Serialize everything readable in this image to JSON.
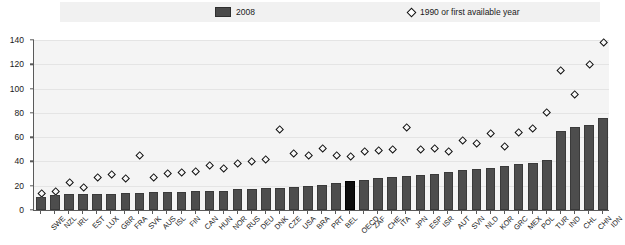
{
  "legend": {
    "bar_label": "2008",
    "marker_label": "1990 or first available year",
    "bar_color": "#4d4d4d",
    "marker_icon": "diamond-open-icon"
  },
  "axes": {
    "y_ticks": [
      0,
      20,
      40,
      60,
      80,
      100,
      120,
      140
    ],
    "y_min": 0,
    "y_max": 140
  },
  "chart_data": {
    "type": "bar",
    "title": "",
    "subtitle": "",
    "xlabel": "",
    "ylabel": "",
    "ylim": [
      0,
      140
    ],
    "grid": true,
    "legend_position": "top",
    "highlight_category": "OECD",
    "categories": [
      "SWE",
      "NZL",
      "IRL",
      "EST",
      "LUX",
      "GBR",
      "FRA",
      "SVK",
      "AUS",
      "ISL",
      "FIN",
      "CAN",
      "HUN",
      "NOR",
      "RUS",
      "DEU",
      "DNK",
      "CZE",
      "USA",
      "BRA",
      "PRT",
      "BEL",
      "OECD",
      "ZAF",
      "CHE",
      "ITA",
      "JPN",
      "ESP",
      "ISR",
      "AUT",
      "SVN",
      "NLD",
      "KOR",
      "GRC",
      "MEX",
      "POL",
      "TUR",
      "IND",
      "CHL",
      "CHN",
      "IDN"
    ],
    "series": [
      {
        "name": "2008",
        "type": "bar",
        "values": [
          11,
          12,
          13,
          13,
          13,
          13,
          14,
          14,
          15,
          15,
          15,
          16,
          16,
          16,
          17,
          17,
          18,
          18,
          19,
          20,
          21,
          22,
          24,
          25,
          26,
          27,
          28,
          29,
          30,
          31,
          33,
          34,
          35,
          36,
          38,
          39,
          41,
          65,
          68,
          70,
          76
        ]
      },
      {
        "name": "1990 or first available year",
        "type": "scatter",
        "values": [
          14,
          15,
          23,
          19,
          27,
          29,
          26,
          45,
          27,
          30,
          31,
          32,
          37,
          34,
          38,
          40,
          42,
          66,
          47,
          45,
          51,
          45,
          44,
          48,
          49,
          50,
          68,
          50,
          51,
          48,
          57,
          55,
          63,
          52,
          64,
          67,
          80,
          115,
          95,
          120,
          138
        ]
      }
    ]
  }
}
